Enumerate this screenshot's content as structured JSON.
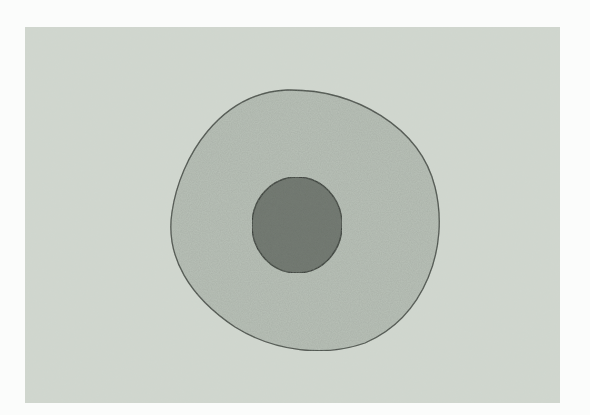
{
  "figure": {
    "subject": "cell illustration",
    "colors": {
      "page_background": "#fbfcfb",
      "plate": "#d0d7cf",
      "cytoplasm": "#b9c1b8",
      "cell_membrane": "#4a4f49",
      "nucleus": "#6f766e",
      "nucleus_granules": "#3e433d"
    },
    "parts": [
      {
        "name": "cell-membrane"
      },
      {
        "name": "cytoplasm"
      },
      {
        "name": "nucleus"
      }
    ]
  }
}
